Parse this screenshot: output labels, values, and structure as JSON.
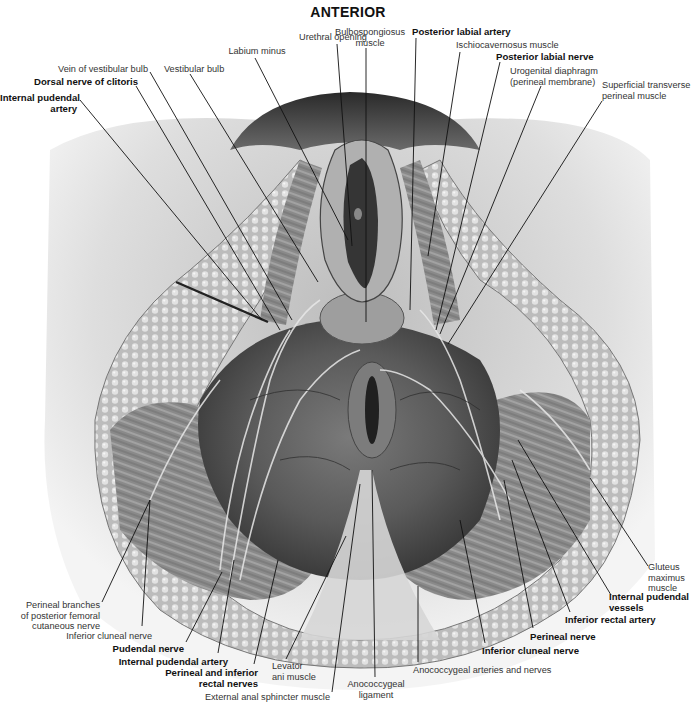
{
  "title": "ANTERIOR",
  "colors": {
    "background": "#ffffff",
    "skin": "#d9d9d9",
    "fat": "#c8c8c8",
    "muscle": "#8a8a8a",
    "dark": "#3a3a3a",
    "leader": "#111111"
  },
  "labels": [
    {
      "id": "urethral-opening",
      "lines": [
        "Urethral opening"
      ],
      "bold": false,
      "align": "c",
      "x": 290,
      "y": 32,
      "w": 86,
      "leader": [
        [
          337,
          44
        ],
        [
          352,
          246
        ]
      ]
    },
    {
      "id": "bulbospongiosus-muscle",
      "lines": [
        "Bulbospongiosus",
        "muscle"
      ],
      "bold": false,
      "align": "c",
      "x": 330,
      "y": 27,
      "w": 80,
      "leader": [
        [
          366,
          48
        ],
        [
          366,
          322
        ]
      ]
    },
    {
      "id": "posterior-labial-artery",
      "lines": [
        "Posterior labial artery"
      ],
      "bold": true,
      "align": "l",
      "x": 412,
      "y": 27,
      "w": 110,
      "leader": [
        [
          416,
          38
        ],
        [
          410,
          310
        ]
      ]
    },
    {
      "id": "labium-minus",
      "lines": [
        "Labium minus"
      ],
      "bold": false,
      "align": "c",
      "x": 222,
      "y": 46,
      "w": 70,
      "leader": [
        [
          255,
          58
        ],
        [
          348,
          240
        ]
      ]
    },
    {
      "id": "ischiocavernosus-muscle",
      "lines": [
        "Ischiocavernosus muscle"
      ],
      "bold": false,
      "align": "l",
      "x": 456,
      "y": 40,
      "w": 120,
      "leader": [
        [
          460,
          52
        ],
        [
          428,
          256
        ]
      ]
    },
    {
      "id": "posterior-labial-nerve",
      "lines": [
        "Posterior labial nerve"
      ],
      "bold": true,
      "align": "l",
      "x": 496,
      "y": 52,
      "w": 110,
      "leader": [
        [
          500,
          62
        ],
        [
          436,
          330
        ]
      ]
    },
    {
      "id": "vein-of-vestibular-bulb",
      "lines": [
        "Vein of vestibular bulb"
      ],
      "bold": false,
      "align": "r",
      "x": 36,
      "y": 64,
      "w": 112,
      "leader": [
        [
          150,
          72
        ],
        [
          292,
          320
        ]
      ]
    },
    {
      "id": "vestibular-bulb",
      "lines": [
        "Vestibular bulb"
      ],
      "bold": false,
      "align": "l",
      "x": 164,
      "y": 64,
      "w": 76,
      "leader": [
        [
          190,
          74
        ],
        [
          318,
          282
        ]
      ]
    },
    {
      "id": "urogenital-diaphragm",
      "lines": [
        "Urogenital diaphragm",
        "(perineal membrane)"
      ],
      "bold": false,
      "align": "l",
      "x": 510,
      "y": 66,
      "w": 104,
      "leader": [
        [
          541,
          86
        ],
        [
          440,
          334
        ]
      ]
    },
    {
      "id": "superficial-transverse-perineal-muscle",
      "lines": [
        "Superficial transverse",
        "perineal muscle"
      ],
      "bold": false,
      "align": "l",
      "x": 602,
      "y": 80,
      "w": 94,
      "leader": [
        [
          602,
          101
        ],
        [
          448,
          344
        ]
      ]
    },
    {
      "id": "dorsal-nerve-of-clitoris",
      "lines": [
        "Dorsal nerve of clitoris"
      ],
      "bold": true,
      "align": "r",
      "x": 14,
      "y": 77,
      "w": 124,
      "leader": [
        [
          136,
          86
        ],
        [
          280,
          330
        ]
      ]
    },
    {
      "id": "internal-pudendal-artery-top",
      "lines": [
        "Internal pudendal",
        "artery"
      ],
      "bold": true,
      "align": "r",
      "x": 0,
      "y": 93,
      "w": 77,
      "leader": [
        [
          80,
          100
        ],
        [
          262,
          320
        ]
      ]
    },
    {
      "id": "gluteus-maximus-muscle",
      "lines": [
        "Gluteus",
        "maximus",
        "muscle"
      ],
      "bold": false,
      "align": "l",
      "x": 648,
      "y": 562,
      "w": 48,
      "leader": [
        [
          648,
          566
        ],
        [
          590,
          478
        ]
      ]
    },
    {
      "id": "internal-pudendal-vessels",
      "lines": [
        "Internal pudendal",
        "vessels"
      ],
      "bold": true,
      "align": "l",
      "x": 609,
      "y": 592,
      "w": 88,
      "leader": [
        [
          611,
          595
        ],
        [
          518,
          440
        ]
      ]
    },
    {
      "id": "inferior-rectal-artery",
      "lines": [
        "Inferior rectal artery"
      ],
      "bold": true,
      "align": "l",
      "x": 565,
      "y": 615,
      "w": 112,
      "leader": [
        [
          570,
          612
        ],
        [
          512,
          460
        ]
      ]
    },
    {
      "id": "perineal-nerve",
      "lines": [
        "Perineal nerve"
      ],
      "bold": true,
      "align": "l",
      "x": 530,
      "y": 632,
      "w": 76,
      "leader": [
        [
          533,
          628
        ],
        [
          504,
          480
        ]
      ]
    },
    {
      "id": "inferior-cluneal-nerve-right",
      "lines": [
        "Inferior cluneal nerve"
      ],
      "bold": true,
      "align": "l",
      "x": 482,
      "y": 646,
      "w": 110,
      "leader": [
        [
          485,
          643
        ],
        [
          460,
          520
        ]
      ]
    },
    {
      "id": "anococcygeal-arteries-and-nerves",
      "lines": [
        "Anococcygeal arteries and nerves"
      ],
      "bold": false,
      "align": "l",
      "x": 413,
      "y": 665,
      "w": 150,
      "leader": [
        [
          418,
          662
        ],
        [
          418,
          586
        ]
      ]
    },
    {
      "id": "anococcygeal-ligament",
      "lines": [
        "Anococcygeal",
        "ligament"
      ],
      "bold": false,
      "align": "c",
      "x": 346,
      "y": 679,
      "w": 60,
      "leader": [
        [
          375,
          677
        ],
        [
          372,
          470
        ]
      ]
    },
    {
      "id": "perineal-branches-of-posterior-femoral-cutaneous-nerve",
      "lines": [
        "Perineal branches",
        "of posterior femoral",
        "cutaneous nerve"
      ],
      "bold": false,
      "align": "r",
      "x": 12,
      "y": 600,
      "w": 88,
      "leader": [
        [
          102,
          602
        ],
        [
          150,
          500
        ]
      ]
    },
    {
      "id": "inferior-cluneal-nerve-left",
      "lines": [
        "Inferior cluneal nerve"
      ],
      "bold": false,
      "align": "r",
      "x": 60,
      "y": 631,
      "w": 92,
      "leader": [
        [
          142,
          626
        ],
        [
          150,
          500
        ]
      ]
    },
    {
      "id": "pudendal-nerve",
      "lines": [
        "Pudendal nerve"
      ],
      "bold": true,
      "align": "r",
      "x": 108,
      "y": 644,
      "w": 76,
      "leader": [
        [
          186,
          642
        ],
        [
          222,
          572
        ]
      ]
    },
    {
      "id": "internal-pudendal-artery-bottom",
      "lines": [
        "Internal pudendal artery"
      ],
      "bold": true,
      "align": "r",
      "x": 106,
      "y": 657,
      "w": 122,
      "leader": [
        [
          218,
          653
        ],
        [
          234,
          560
        ]
      ]
    },
    {
      "id": "perineal-and-inferior-rectal-nerves",
      "lines": [
        "Perineal and inferior",
        "rectal nerves"
      ],
      "bold": true,
      "align": "r",
      "x": 150,
      "y": 668,
      "w": 108,
      "leader": [
        [
          254,
          664
        ],
        [
          278,
          560
        ]
      ]
    },
    {
      "id": "levator-ani-muscle",
      "lines": [
        "Levator",
        "ani muscle"
      ],
      "bold": false,
      "align": "l",
      "x": 272,
      "y": 661,
      "w": 56,
      "leader": [
        [
          286,
          659
        ],
        [
          346,
          536
        ]
      ]
    },
    {
      "id": "external-anal-sphincter-muscle",
      "lines": [
        "External anal sphincter muscle"
      ],
      "bold": false,
      "align": "r",
      "x": 200,
      "y": 692,
      "w": 130,
      "leader": [
        [
          332,
          692
        ],
        [
          360,
          484
        ]
      ]
    }
  ]
}
